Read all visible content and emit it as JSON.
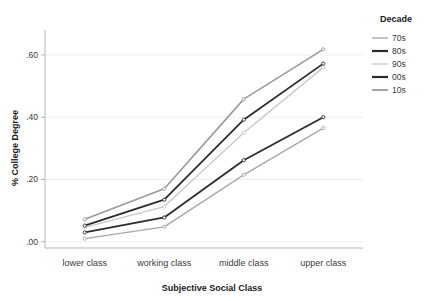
{
  "chart_data": {
    "type": "line",
    "title": "",
    "xlabel": "Subjective Social Class",
    "ylabel": "% College Degree",
    "categories": [
      "lower class",
      "working class",
      "middle class",
      "upper class"
    ],
    "ytick_labels": [
      ".00",
      ".20",
      ".40",
      ".60"
    ],
    "ytick_values": [
      0.0,
      0.2,
      0.4,
      0.6
    ],
    "ylim": [
      -0.02,
      0.68
    ],
    "grid": true,
    "legend_position": "right",
    "legend_title": "Decade",
    "markers": "small-circle",
    "series": [
      {
        "name": "70s",
        "color": "#a8a8a8",
        "width": 1.4,
        "values": [
          0.01,
          0.048,
          0.215,
          0.365
        ]
      },
      {
        "name": "80s",
        "color": "#2b2b2b",
        "width": 1.8,
        "values": [
          0.03,
          0.078,
          0.262,
          0.4
        ]
      },
      {
        "name": "90s",
        "color": "#c9c9c9",
        "width": 1.4,
        "values": [
          0.046,
          0.113,
          0.35,
          0.56
        ]
      },
      {
        "name": "00s",
        "color": "#2b2b2b",
        "width": 1.8,
        "values": [
          0.052,
          0.135,
          0.392,
          0.572
        ]
      },
      {
        "name": "10s",
        "color": "#9a9a9a",
        "width": 1.6,
        "values": [
          0.072,
          0.17,
          0.458,
          0.618
        ]
      }
    ]
  },
  "legend": {
    "title": "Decade",
    "items": [
      {
        "label": "70s",
        "color": "#a8a8a8",
        "width": 1.4
      },
      {
        "label": "80s",
        "color": "#2b2b2b",
        "width": 2.2
      },
      {
        "label": "90s",
        "color": "#c9c9c9",
        "width": 1.4
      },
      {
        "label": "00s",
        "color": "#2b2b2b",
        "width": 2.2
      },
      {
        "label": "10s",
        "color": "#9a9a9a",
        "width": 1.8
      }
    ]
  },
  "axes": {
    "y_title": "% College Degree",
    "x_title": "Subjective Social Class"
  },
  "style": {
    "grid_color": "#ededed",
    "axis_color": "#b4b4b4",
    "background": "#ffffff"
  }
}
